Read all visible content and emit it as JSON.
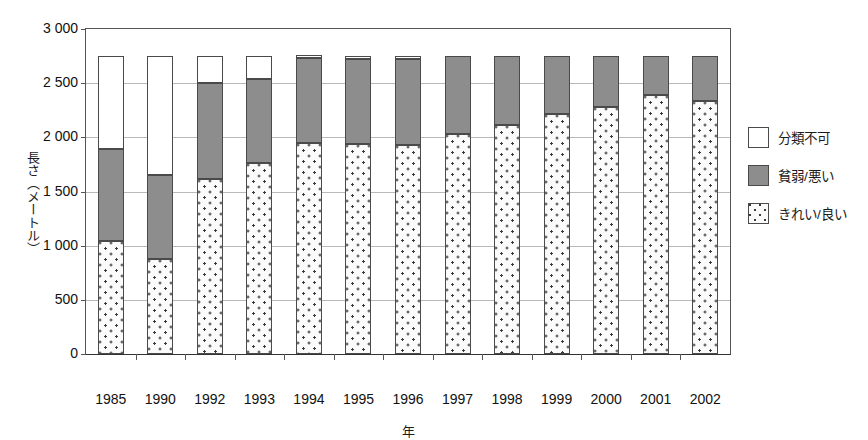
{
  "chart_data": {
    "type": "bar",
    "stacked": true,
    "title": "",
    "xlabel": "年",
    "ylabel": "長さ（メートル）",
    "categories": [
      "1985",
      "1990",
      "1992",
      "1993",
      "1994",
      "1995",
      "1996",
      "1997",
      "1998",
      "1999",
      "2000",
      "2001",
      "2002"
    ],
    "ylim": [
      0,
      3000
    ],
    "yticks": [
      0,
      500,
      1000,
      1500,
      2000,
      2500,
      3000
    ],
    "ytick_labels": [
      "0",
      "500",
      "1 000",
      "1 500",
      "2 000",
      "2 500",
      "3 000"
    ],
    "grid": true,
    "legend_position": "right",
    "series": [
      {
        "name": "きれい/良い",
        "key": "clean",
        "color": "#fbfbfb",
        "pattern": "dotted",
        "values": [
          1045,
          880,
          1620,
          1760,
          1950,
          1940,
          1930,
          2030,
          2110,
          2220,
          2280,
          2390,
          2340
        ]
      },
      {
        "name": "貧弱/悪い",
        "key": "poor",
        "color": "#8d8d8d",
        "pattern": "solid-gray",
        "values": [
          845,
          770,
          880,
          780,
          780,
          780,
          790,
          720,
          640,
          530,
          470,
          360,
          410
        ]
      },
      {
        "name": "分類不可",
        "key": "unclassified",
        "color": "#ffffff",
        "pattern": "white",
        "values": [
          860,
          1100,
          250,
          210,
          30,
          30,
          30,
          0,
          0,
          0,
          0,
          0,
          0
        ]
      }
    ],
    "totals": [
      2750,
      2750,
      2750,
      2750,
      2760,
      2750,
      2750,
      2750,
      2750,
      2750,
      2750,
      2750,
      2750
    ]
  },
  "legend": {
    "items": [
      {
        "label": "分類不可",
        "swatch": "white-square-icon"
      },
      {
        "label": "貧弱/悪い",
        "swatch": "gray-square-icon"
      },
      {
        "label": "きれい/良い",
        "swatch": "dotted-square-icon"
      }
    ]
  },
  "axes": {
    "y_title": "長さ（メートル）",
    "x_title": "年"
  }
}
